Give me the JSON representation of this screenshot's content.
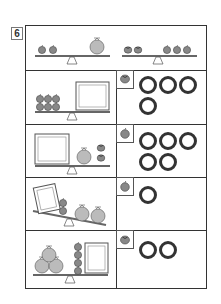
{
  "problem": {
    "number": "6"
  },
  "examples": [
    {
      "left": "2 apples",
      "right": "1 melon",
      "note": "balance level"
    },
    {
      "left": "2 persimmons",
      "right": "3 apples",
      "note": "balance level"
    }
  ],
  "rows": [
    {
      "scene": "6 apples on left, empty box on right",
      "answer_icon": "persimmon-icon",
      "circle_count": 4
    },
    {
      "scene": "empty box on left, 1 melon and 2 persimmons on right",
      "answer_icon": "apple-icon",
      "circle_count": 5
    },
    {
      "scene": "tilted: box and 2 apples on left (up), 2 melons on right (down)",
      "answer_icon": "apple-icon",
      "circle_count": 1
    },
    {
      "scene": "3 melons and 3 apples on left, empty box on right",
      "answer_icon": "persimmon-icon",
      "circle_count": 2
    }
  ],
  "colors": {
    "line": "#333333",
    "fruit": "#888888",
    "fruit_dark": "#555555",
    "melon": "#bbbbbb"
  }
}
